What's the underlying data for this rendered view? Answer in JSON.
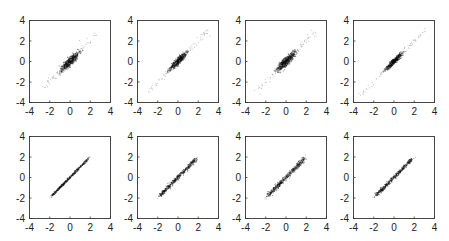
{
  "figure": {
    "layout": {
      "rows": 2,
      "cols": 4
    },
    "colors": {
      "axis": "#333333",
      "point_dense": "#111111",
      "point_sparse": "#9a9a9a",
      "background": "#ffffff"
    }
  },
  "chart_data": [
    {
      "type": "scatter",
      "panel": "row1-col1",
      "title": "",
      "xlabel": "",
      "ylabel": "",
      "xlim": [
        -4,
        4
      ],
      "ylim": [
        -4,
        4
      ],
      "xticks": [
        -4,
        -2,
        0,
        2,
        4
      ],
      "yticks": [
        -4,
        -2,
        0,
        2,
        4
      ],
      "grid": false,
      "description": "Dense elongated cloud along y=x centered at origin, core spans ~-1..1, sparse tail to ~-2.5..2.5",
      "center": [
        0,
        0
      ],
      "slope": 1.0,
      "core_spread": 1.0,
      "tail_spread": 2.6,
      "width": 0.28,
      "seed": 11
    },
    {
      "type": "scatter",
      "panel": "row1-col2",
      "title": "",
      "xlabel": "",
      "ylabel": "",
      "xlim": [
        -4,
        4
      ],
      "ylim": [
        -4,
        4
      ],
      "xticks": [
        -4,
        -2,
        0,
        2,
        4
      ],
      "yticks": [
        -4,
        -2,
        0,
        2,
        4
      ],
      "grid": false,
      "description": "Dense elongated cloud along y=x, core ~-1..1, sparse tail to ~-3..3",
      "center": [
        0,
        0
      ],
      "slope": 1.0,
      "core_spread": 0.95,
      "tail_spread": 3.0,
      "width": 0.22,
      "seed": 23
    },
    {
      "type": "scatter",
      "panel": "row1-col3",
      "title": "",
      "xlabel": "",
      "ylabel": "",
      "xlim": [
        -4,
        4
      ],
      "ylim": [
        -4,
        4
      ],
      "xticks": [
        -4,
        -2,
        0,
        2,
        4
      ],
      "yticks": [
        -4,
        -2,
        0,
        2,
        4
      ],
      "grid": false,
      "description": "Dense elongated cloud along y=x, core ~-1..1, sparse tail to ~-2..3",
      "center": [
        0,
        0
      ],
      "slope": 1.0,
      "core_spread": 1.0,
      "tail_spread": 3.0,
      "width": 0.3,
      "seed": 37
    },
    {
      "type": "scatter",
      "panel": "row1-col4",
      "title": "",
      "xlabel": "",
      "ylabel": "",
      "xlim": [
        -4,
        4
      ],
      "ylim": [
        -4,
        4
      ],
      "xticks": [
        -4,
        -2,
        0,
        2,
        4
      ],
      "yticks": [
        -4,
        -2,
        0,
        2,
        4
      ],
      "grid": false,
      "description": "Narrow dense cloud along y=x, core ~-1..1, sparse faint tail to ~-3..3.5",
      "center": [
        0,
        0
      ],
      "slope": 1.0,
      "core_spread": 0.9,
      "tail_spread": 3.3,
      "width": 0.18,
      "seed": 41
    },
    {
      "type": "scatter",
      "panel": "row2-col1",
      "title": "",
      "xlabel": "",
      "ylabel": "",
      "xlim": [
        -4,
        4
      ],
      "ylim": [
        -4,
        4
      ],
      "xticks": [
        -4,
        -2,
        0,
        2,
        4
      ],
      "yticks": [
        -4,
        -2,
        0,
        2,
        4
      ],
      "grid": false,
      "description": "Thin line-like cloud along y=x spanning ~-2..2",
      "center": [
        0,
        0
      ],
      "slope": 1.0,
      "core_spread": 1.9,
      "tail_spread": 2.0,
      "width": 0.1,
      "seed": 53
    },
    {
      "type": "scatter",
      "panel": "row2-col2",
      "title": "",
      "xlabel": "",
      "ylabel": "",
      "xlim": [
        -4,
        4
      ],
      "ylim": [
        -4,
        4
      ],
      "xticks": [
        -4,
        -2,
        0,
        2,
        4
      ],
      "yticks": [
        -4,
        -2,
        0,
        2,
        4
      ],
      "grid": false,
      "description": "Thin cloud along y=x spanning ~-2..2",
      "center": [
        0,
        0
      ],
      "slope": 1.0,
      "core_spread": 1.9,
      "tail_spread": 2.1,
      "width": 0.17,
      "seed": 67
    },
    {
      "type": "scatter",
      "panel": "row2-col3",
      "title": "",
      "xlabel": "",
      "ylabel": "",
      "xlim": [
        -4,
        4
      ],
      "ylim": [
        -4,
        4
      ],
      "xticks": [
        -4,
        -2,
        0,
        2,
        4
      ],
      "yticks": [
        -4,
        -2,
        0,
        2,
        4
      ],
      "grid": false,
      "description": "Cloud along y=x spanning ~-2..2, slightly wider",
      "center": [
        0,
        0
      ],
      "slope": 1.0,
      "core_spread": 1.9,
      "tail_spread": 2.1,
      "width": 0.2,
      "seed": 79
    },
    {
      "type": "scatter",
      "panel": "row2-col4",
      "title": "",
      "xlabel": "",
      "ylabel": "",
      "xlim": [
        -4,
        4
      ],
      "ylim": [
        -4,
        4
      ],
      "xticks": [
        -4,
        -2,
        0,
        2,
        4
      ],
      "yticks": [
        -4,
        -2,
        0,
        2,
        4
      ],
      "grid": false,
      "description": "Cloud along y=x spanning ~-2..2",
      "center": [
        0,
        0
      ],
      "slope": 1.0,
      "core_spread": 1.85,
      "tail_spread": 2.1,
      "width": 0.16,
      "seed": 97
    }
  ]
}
